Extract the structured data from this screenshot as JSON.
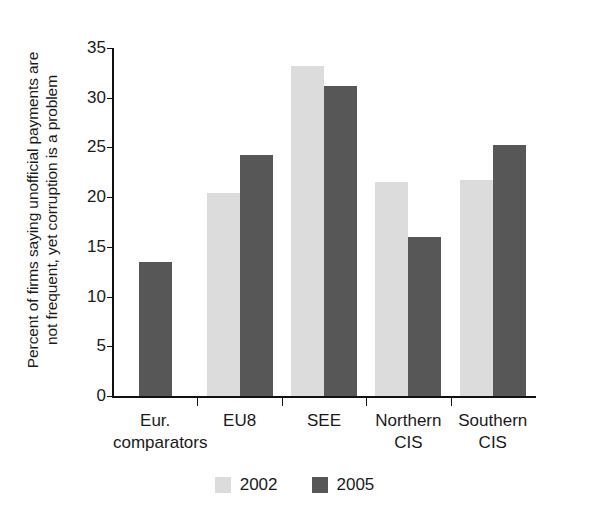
{
  "figure": {
    "background_color": "#ffffff",
    "axis_color": "#111111",
    "text_color": "#1a1a1a"
  },
  "axis": {
    "y_title_line1": "Percent of firms saying unofficial payments are",
    "y_title_line2": "not frequent, yet corruption is a problem",
    "y_ticks": [
      "0",
      "5",
      "10",
      "15",
      "20",
      "25",
      "30",
      "35"
    ],
    "y_tick_values": [
      0,
      5,
      10,
      15,
      20,
      25,
      30,
      35
    ]
  },
  "categories_display": [
    {
      "line1": "Eur.",
      "line2": "comparators"
    },
    {
      "line1": "EU8",
      "line2": ""
    },
    {
      "line1": "SEE",
      "line2": ""
    },
    {
      "line1": "Northern",
      "line2": "CIS"
    },
    {
      "line1": "Southern",
      "line2": "CIS"
    }
  ],
  "legend": {
    "items": [
      {
        "label": "2002",
        "color": "#dcdcdc"
      },
      {
        "label": "2005",
        "color": "#575757"
      }
    ]
  },
  "chart_data": {
    "type": "bar",
    "title": "",
    "subtitle": "",
    "xlabel": "",
    "ylabel": "Percent of firms saying unofficial payments are not frequent, yet corruption is a problem",
    "categories": [
      "Eur. comparators",
      "EU8",
      "SEE",
      "Northern CIS",
      "Southern CIS"
    ],
    "series": [
      {
        "name": "2002",
        "color": "#dcdcdc",
        "values": [
          null,
          20.4,
          33.2,
          21.5,
          21.7
        ]
      },
      {
        "name": "2005",
        "color": "#575757",
        "values": [
          13.5,
          24.2,
          31.2,
          16.0,
          25.2
        ]
      }
    ],
    "ylim": [
      0,
      35
    ],
    "ytick_step": 5,
    "grid": false,
    "legend_position": "bottom-center"
  }
}
